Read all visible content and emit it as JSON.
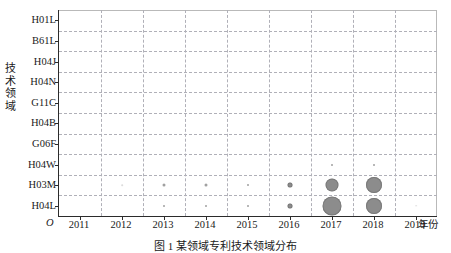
{
  "axes": {
    "y_title": "技术领域",
    "y_title_chars": [
      "技",
      "术",
      "领",
      "域"
    ],
    "x_unit_label": "年份",
    "origin_label": "O"
  },
  "caption": "图 1  某领域专利技术领域分布",
  "style": {
    "bubble_color": "#8c8c8c",
    "bubble_stroke": "#7a7a7a",
    "axis_color": "#2b2b2b",
    "grid_color": "#b0b0b8",
    "background": "#ffffff"
  },
  "chart_data": {
    "type": "scatter",
    "title": "",
    "xlabel": "年份",
    "ylabel": "技术领域",
    "grid": true,
    "legend": "none",
    "x": [
      "2011",
      "2012",
      "2013",
      "2014",
      "2015",
      "2016",
      "2017",
      "2018",
      "2019"
    ],
    "categories": [
      "H01L",
      "B61L",
      "H04J",
      "H04N",
      "G11C",
      "H04B",
      "G06F",
      "H04W",
      "H03M",
      "H04L"
    ],
    "points": [
      {
        "x": "2012",
        "y": "H03M",
        "size": 1
      },
      {
        "x": "2013",
        "y": "H03M",
        "size": 3
      },
      {
        "x": "2013",
        "y": "H04L",
        "size": 2
      },
      {
        "x": "2014",
        "y": "H03M",
        "size": 3
      },
      {
        "x": "2014",
        "y": "H04L",
        "size": 2
      },
      {
        "x": "2015",
        "y": "H03M",
        "size": 2
      },
      {
        "x": "2015",
        "y": "H04L",
        "size": 2
      },
      {
        "x": "2016",
        "y": "H03M",
        "size": 5
      },
      {
        "x": "2016",
        "y": "H04L",
        "size": 5
      },
      {
        "x": "2017",
        "y": "H04W",
        "size": 2
      },
      {
        "x": "2017",
        "y": "H03M",
        "size": 13
      },
      {
        "x": "2017",
        "y": "H04L",
        "size": 19
      },
      {
        "x": "2018",
        "y": "H04W",
        "size": 2
      },
      {
        "x": "2018",
        "y": "H03M",
        "size": 16
      },
      {
        "x": "2018",
        "y": "H04L",
        "size": 16
      },
      {
        "x": "2019",
        "y": "H04L",
        "size": 1
      }
    ]
  }
}
